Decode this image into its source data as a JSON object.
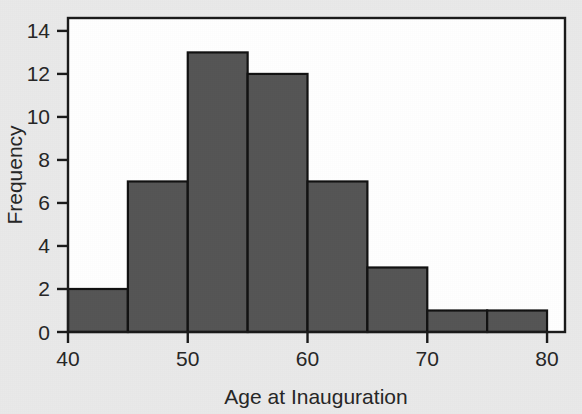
{
  "chart_data": {
    "type": "bar",
    "title": "",
    "subtitle": "",
    "xlabel": "Age at Inauguration",
    "ylabel": "Frequency",
    "categories": [
      "40-45",
      "45-50",
      "50-55",
      "55-60",
      "60-65",
      "65-70",
      "70-75",
      "75-80"
    ],
    "bin_edges": [
      40,
      45,
      50,
      55,
      60,
      65,
      70,
      75,
      80
    ],
    "values": [
      2,
      7,
      13,
      12,
      7,
      3,
      1,
      1
    ],
    "bin_width": 5,
    "xlim": [
      40,
      81.5
    ],
    "ylim": [
      0,
      14.6
    ],
    "x_ticks": [
      40,
      50,
      60,
      70,
      80
    ],
    "x_tick_labels": [
      "40",
      "50",
      "60",
      "70",
      "80"
    ],
    "y_ticks": [
      0,
      2,
      4,
      6,
      8,
      10,
      12,
      14
    ],
    "y_tick_labels": [
      "0",
      "2",
      "4",
      "6",
      "8",
      "10",
      "12",
      "14"
    ],
    "grid": false,
    "legend": null,
    "legend_position": "none",
    "annotations": [],
    "total_count": 46
  },
  "style": {
    "page_background": "#e9e9e9",
    "plot_background": "#ffffff",
    "bar_fill": "#555555",
    "bar_stroke": "#111111",
    "axis_color": "#1a1a1a",
    "text_color": "#262626"
  }
}
